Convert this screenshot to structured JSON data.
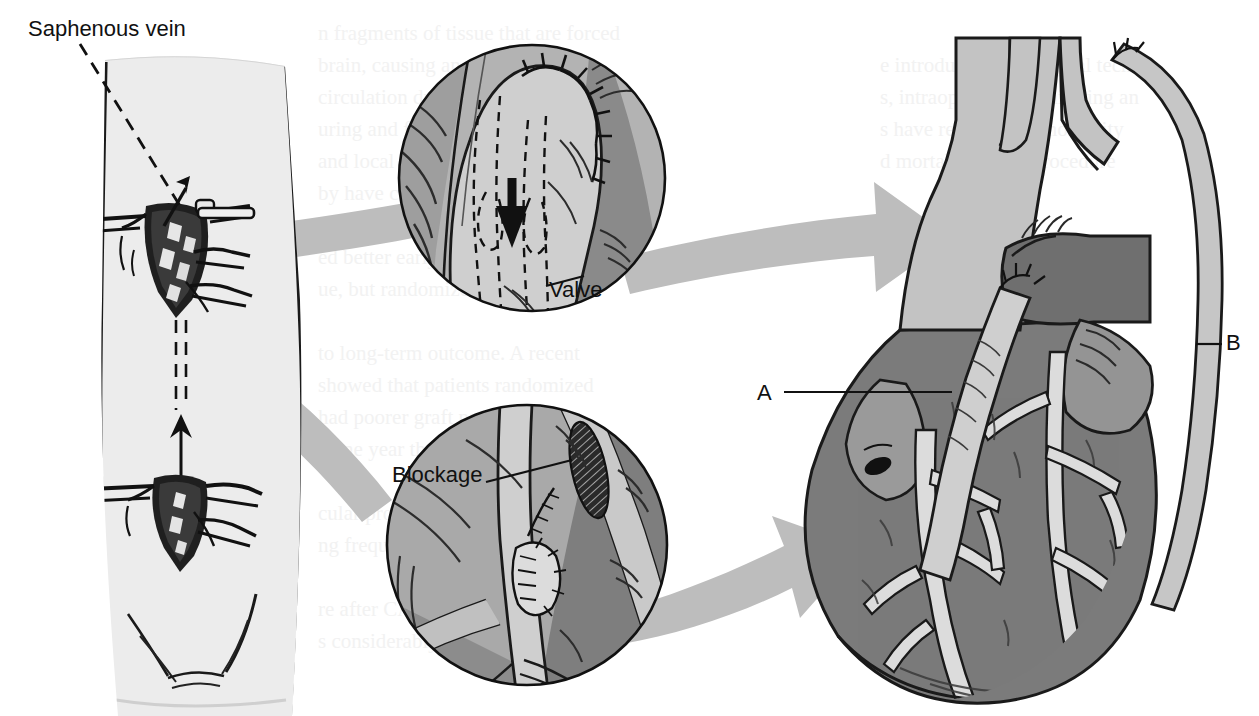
{
  "figure": {
    "kind": "medical-illustration",
    "background_color": "#ffffff"
  },
  "labels": {
    "saphenous_vein": "Saphenous vein",
    "valve": "Valve",
    "blockage": "Blockage",
    "marker_a": "A",
    "marker_b": "B"
  },
  "panels": {
    "leg": {
      "name": "donor-leg-panel",
      "description": "Lower limb with two surgical incisions and retractors, dashed harvest path with upward arrow",
      "skin_color": "#ececec",
      "outline_color": "#1a1a1a"
    },
    "inset_top": {
      "name": "valve-inset",
      "description": "Magnified vein graft anastomosis with suture line, internal valve shown dashed, flow arrow pointing down",
      "fill_light": "#b8b8b8",
      "fill_dark": "#8a8a8a"
    },
    "inset_bottom": {
      "name": "blockage-inset",
      "description": "Magnified coronary artery with hatched atherosclerotic blockage and distal sutured anastomosis",
      "fill_light": "#b8b8b8",
      "fill_dark": "#8a8a8a"
    },
    "heart": {
      "name": "heart-panel",
      "description": "Anterior heart with aorta, great vessels, pulmonary artery and two vein grafts",
      "aorta_color": "#c3c3c3",
      "pulmonary_color": "#6f6f6f",
      "myocardium_color": "#7b7b7b",
      "vessel_color": "#d8d8d8"
    }
  },
  "arrows": {
    "color": "#bdbdbd",
    "items": [
      {
        "name": "swoosh-leg-to-valve-inset",
        "from": "leg",
        "to": "inset_top"
      },
      {
        "name": "swoosh-valve-inset-to-heart",
        "from": "inset_top",
        "to": "heart"
      },
      {
        "name": "swoosh-leg-to-blockage-inset",
        "from": "leg",
        "to": "inset_bottom"
      },
      {
        "name": "swoosh-blockage-inset-to-heart",
        "from": "inset_bottom",
        "to": "heart"
      }
    ]
  },
  "ghost_text": {
    "description": "Faint show-through text from the reverse page, illegible",
    "color": "#f0f0f0"
  }
}
